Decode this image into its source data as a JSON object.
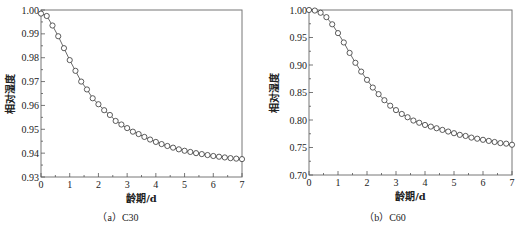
{
  "chart_data": [
    {
      "type": "line",
      "title": "",
      "caption": "（a）C30",
      "xlabel": "龄期/d",
      "ylabel": "相对湿度",
      "xlim": [
        0,
        7
      ],
      "ylim": [
        0.93,
        1.0
      ],
      "xticks": [
        0,
        1,
        2,
        3,
        4,
        5,
        6,
        7
      ],
      "yticks": [
        0.93,
        0.94,
        0.95,
        0.96,
        0.97,
        0.98,
        0.99,
        1.0
      ],
      "ytick_labels": [
        "0.93",
        "0.94",
        "0.95",
        "0.96",
        "0.97",
        "0.98",
        "0.99",
        "1.00"
      ],
      "grid": false,
      "marker": "open-circle",
      "x": [
        0,
        0.2,
        0.4,
        0.6,
        0.8,
        1.0,
        1.2,
        1.4,
        1.6,
        1.8,
        2.0,
        2.2,
        2.4,
        2.6,
        2.8,
        3.0,
        3.2,
        3.4,
        3.6,
        3.8,
        4.0,
        4.2,
        4.4,
        4.6,
        4.8,
        5.0,
        5.2,
        5.4,
        5.6,
        5.8,
        6.0,
        6.2,
        6.4,
        6.6,
        6.8,
        7.0
      ],
      "series": [
        {
          "name": "C30",
          "values": [
            0.9985,
            0.9975,
            0.9935,
            0.989,
            0.984,
            0.979,
            0.9745,
            0.97,
            0.9667,
            0.963,
            0.9605,
            0.958,
            0.956,
            0.9535,
            0.952,
            0.9505,
            0.949,
            0.948,
            0.9468,
            0.9457,
            0.9447,
            0.9438,
            0.943,
            0.9423,
            0.9416,
            0.941,
            0.9405,
            0.94,
            0.9396,
            0.9392,
            0.9388,
            0.9385,
            0.9382,
            0.9379,
            0.9377,
            0.9375
          ]
        }
      ]
    },
    {
      "type": "line",
      "title": "",
      "caption": "（b）C60",
      "xlabel": "龄期/d",
      "ylabel": "相对湿度",
      "xlim": [
        0,
        7
      ],
      "ylim": [
        0.7,
        1.0
      ],
      "xticks": [
        0,
        1,
        2,
        3,
        4,
        5,
        6,
        7
      ],
      "yticks": [
        0.7,
        0.75,
        0.8,
        0.85,
        0.9,
        0.95,
        1.0
      ],
      "ytick_labels": [
        "0.70",
        "0.75",
        "0.80",
        "0.85",
        "0.90",
        "0.95",
        "1.00"
      ],
      "grid": false,
      "marker": "open-circle",
      "x": [
        0,
        0.2,
        0.4,
        0.6,
        0.8,
        1.0,
        1.2,
        1.4,
        1.6,
        1.8,
        2.0,
        2.2,
        2.4,
        2.6,
        2.8,
        3.0,
        3.2,
        3.4,
        3.6,
        3.8,
        4.0,
        4.2,
        4.4,
        4.6,
        4.8,
        5.0,
        5.2,
        5.4,
        5.6,
        5.8,
        6.0,
        6.2,
        6.4,
        6.6,
        6.8,
        7.0
      ],
      "series": [
        {
          "name": "C60",
          "values": [
            1.0,
            0.999,
            0.995,
            0.987,
            0.974,
            0.958,
            0.941,
            0.922,
            0.904,
            0.888,
            0.873,
            0.859,
            0.847,
            0.836,
            0.826,
            0.818,
            0.811,
            0.805,
            0.799,
            0.795,
            0.791,
            0.788,
            0.785,
            0.782,
            0.779,
            0.776,
            0.773,
            0.771,
            0.768,
            0.766,
            0.764,
            0.762,
            0.76,
            0.758,
            0.757,
            0.755
          ]
        }
      ]
    }
  ]
}
